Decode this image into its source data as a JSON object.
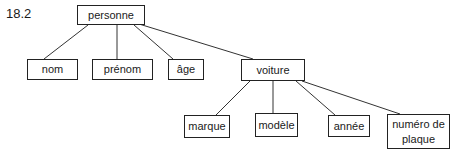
{
  "figure_label": "18.2",
  "tree": {
    "root": "personne",
    "nodes": {
      "personne": {
        "label": "personne",
        "box": [
          77,
          5,
          68,
          20
        ]
      },
      "nom": {
        "label": "nom",
        "box": [
          27,
          59,
          51,
          21
        ]
      },
      "prenom": {
        "label": "prénom",
        "box": [
          92,
          59,
          61,
          21
        ]
      },
      "age": {
        "label": "âge",
        "box": [
          168,
          59,
          36,
          21
        ]
      },
      "voiture": {
        "label": "voiture",
        "box": [
          241,
          59,
          64,
          22
        ]
      },
      "marque": {
        "label": "marque",
        "box": [
          184,
          115,
          46,
          23
        ]
      },
      "modele": {
        "label": "modèle",
        "box": [
          255,
          113,
          43,
          24
        ]
      },
      "annee": {
        "label": "année",
        "box": [
          328,
          115,
          42,
          22
        ]
      },
      "numero": {
        "label": "numéro de plaque",
        "box": [
          387,
          114,
          63,
          35
        ]
      }
    },
    "edges": [
      {
        "from": "personne",
        "to": "nom",
        "line": [
          88,
          25,
          44,
          59
        ]
      },
      {
        "from": "personne",
        "to": "prenom",
        "line": [
          117,
          25,
          117,
          59
        ]
      },
      {
        "from": "personne",
        "to": "age",
        "line": [
          134,
          25,
          173,
          59
        ]
      },
      {
        "from": "personne",
        "to": "voiture",
        "line": [
          139,
          24,
          253,
          59
        ]
      },
      {
        "from": "voiture",
        "to": "marque",
        "line": [
          250,
          81,
          216,
          115
        ]
      },
      {
        "from": "voiture",
        "to": "modele",
        "line": [
          273,
          81,
          273,
          113
        ]
      },
      {
        "from": "voiture",
        "to": "annee",
        "line": [
          296,
          81,
          335,
          115
        ]
      },
      {
        "from": "voiture",
        "to": "numero",
        "line": [
          302,
          81,
          400,
          114
        ]
      }
    ]
  }
}
